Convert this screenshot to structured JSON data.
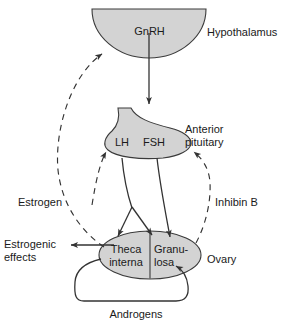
{
  "diagram": {
    "colors": {
      "organ_fill": "#d3d3d3",
      "stroke": "#333333",
      "text": "#1a1a1a",
      "background": "#ffffff"
    },
    "organs": [
      {
        "id": "hypothalamus",
        "label": "Hypothalamus",
        "shape": "semicircle"
      },
      {
        "id": "anterior-pituitary",
        "label": "Anterior\npituitary",
        "shape": "pituitary-gland"
      },
      {
        "id": "ovary",
        "label": "Ovary",
        "shape": "ellipse"
      }
    ],
    "labels": {
      "gnrh": "GnRH",
      "hypothalamus": "Hypothalamus",
      "lh": "LH",
      "fsh": "FSH",
      "anterior_pituitary_line1": "Anterior",
      "anterior_pituitary_line2": "pituitary",
      "estrogen": "Estrogen",
      "inhibin_b": "Inhibin B",
      "estrogenic_effects_line1": "Estrogenic",
      "estrogenic_effects_line2": "effects",
      "theca_line1": "Theca",
      "theca_line2": "interna",
      "granulosa_line1": "Granu-",
      "granulosa_line2": "losa",
      "ovary": "Ovary",
      "androgens": "Androgens"
    },
    "compartments": [
      {
        "id": "theca-interna",
        "label": "Theca interna"
      },
      {
        "id": "granulosa",
        "label": "Granulosa"
      }
    ],
    "hormones": [
      {
        "id": "gnrh",
        "name": "GnRH",
        "from": "hypothalamus",
        "to": "anterior-pituitary",
        "style": "solid",
        "effect": "stimulatory"
      },
      {
        "id": "lh",
        "name": "LH",
        "from": "anterior-pituitary",
        "to": "theca-interna",
        "style": "solid",
        "effect": "stimulatory"
      },
      {
        "id": "fsh",
        "name": "FSH",
        "from": "anterior-pituitary",
        "to": "granulosa",
        "style": "solid",
        "effect": "stimulatory"
      },
      {
        "id": "androgens",
        "name": "Androgens",
        "from": "theca-interna",
        "to": "granulosa",
        "style": "solid",
        "effect": "substrate"
      },
      {
        "id": "estrogen",
        "name": "Estrogen",
        "from": "ovary",
        "to": "hypothalamus",
        "style": "dashed",
        "effect": "feedback"
      },
      {
        "id": "inhibin-b",
        "name": "Inhibin B",
        "from": "granulosa",
        "to": "anterior-pituitary",
        "style": "dashed",
        "effect": "feedback"
      },
      {
        "id": "estrogenic-effects",
        "name": "Estrogenic effects",
        "from": "ovary",
        "to": "periphery",
        "style": "solid",
        "effect": "peripheral"
      }
    ]
  }
}
